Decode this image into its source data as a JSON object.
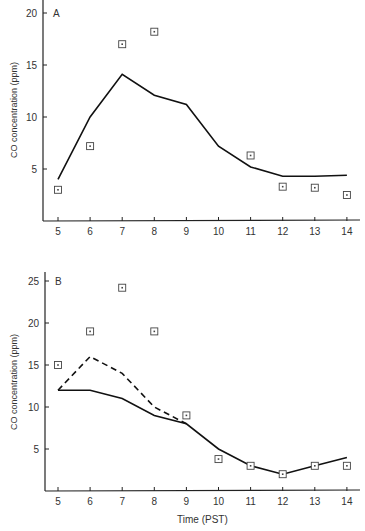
{
  "chart_data": [
    {
      "type": "line",
      "panel": "A",
      "title": "",
      "xlabel": "",
      "ylabel": "CO concentration (ppm)",
      "x": [
        5,
        6,
        7,
        8,
        9,
        10,
        11,
        12,
        13,
        14
      ],
      "xticks": [
        "5",
        "6",
        "7",
        "8",
        "9",
        "10",
        "11",
        "12",
        "13",
        "14"
      ],
      "yticks": [
        "5",
        "10",
        "15",
        "20"
      ],
      "ylim": [
        0,
        20.5
      ],
      "series": [
        {
          "name": "model (solid line)",
          "style": "solid",
          "x": [
            5,
            6,
            7,
            8,
            9,
            10,
            11,
            12,
            13,
            14
          ],
          "values": [
            4.0,
            10.0,
            14.1,
            12.1,
            11.2,
            7.2,
            5.2,
            4.3,
            4.3,
            4.4
          ]
        },
        {
          "name": "observed (squares)",
          "style": "marker",
          "x": [
            5,
            6,
            7,
            8,
            11,
            12,
            13,
            14
          ],
          "values": [
            3.0,
            7.2,
            17.0,
            18.2,
            6.3,
            3.3,
            3.2,
            2.5
          ]
        }
      ]
    },
    {
      "type": "line",
      "panel": "B",
      "title": "",
      "xlabel": "Time (PST)",
      "ylabel": "CO concentration (ppm)",
      "x": [
        5,
        6,
        7,
        8,
        9,
        10,
        11,
        12,
        13,
        14
      ],
      "xticks": [
        "5",
        "6",
        "7",
        "8",
        "9",
        "10",
        "11",
        "12",
        "13",
        "14"
      ],
      "yticks": [
        "5",
        "10",
        "15",
        "20",
        "25"
      ],
      "ylim": [
        0,
        26
      ],
      "series": [
        {
          "name": "model (solid line)",
          "style": "solid",
          "x": [
            5,
            6,
            7,
            8,
            9,
            10,
            11,
            12,
            13,
            14
          ],
          "values": [
            12,
            12,
            11,
            9,
            8,
            5,
            3,
            2,
            3,
            4
          ]
        },
        {
          "name": "model (dashed line)",
          "style": "dashed",
          "x": [
            5,
            6,
            7,
            8,
            9
          ],
          "values": [
            12,
            16,
            14,
            10,
            8
          ]
        },
        {
          "name": "observed (squares)",
          "style": "marker",
          "x": [
            5,
            6,
            7,
            8,
            9,
            10,
            11,
            12,
            13,
            14
          ],
          "values": [
            15,
            19,
            24.2,
            19,
            9,
            3.8,
            3,
            2,
            3,
            3
          ]
        }
      ]
    }
  ],
  "labels": {
    "panel_a": "A",
    "panel_b": "B",
    "ylabel_a": "CO concentration (ppm)",
    "ylabel_b": "CO concentration (ppm)",
    "xlabel_b": "Time (PST)"
  }
}
